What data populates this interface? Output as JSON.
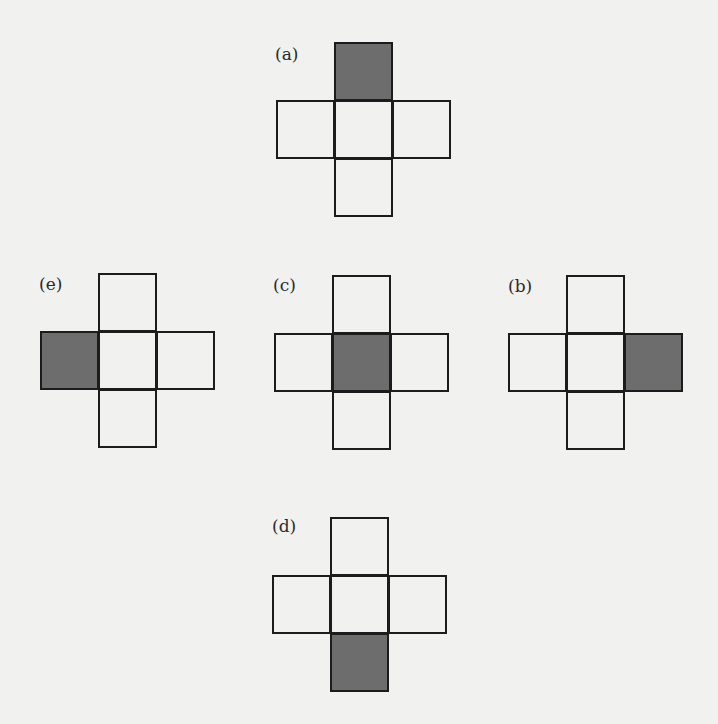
{
  "figure": {
    "colors": {
      "background": "#f1f1ef",
      "line": "#1c1c1c",
      "shaded": "#6d6d6d"
    },
    "nets": [
      {
        "id": "a",
        "label": "(a)",
        "shaded_cell": "top"
      },
      {
        "id": "e",
        "label": "(e)",
        "shaded_cell": "left"
      },
      {
        "id": "c",
        "label": "(c)",
        "shaded_cell": "center"
      },
      {
        "id": "b",
        "label": "(b)",
        "shaded_cell": "right"
      },
      {
        "id": "d",
        "label": "(d)",
        "shaded_cell": "bottom"
      }
    ]
  }
}
